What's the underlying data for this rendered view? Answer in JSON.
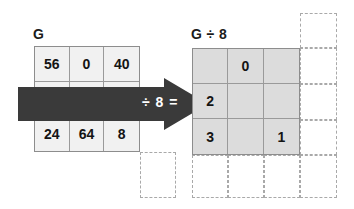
{
  "canvas": {
    "width": 354,
    "height": 209,
    "background": "#ffffff"
  },
  "colors": {
    "source_cell_fill": "#f1f1f1",
    "result_cell_fill": "#dcdcdc",
    "grid_line": "#9a9a9a",
    "ghost_dash": "#a9a9a9",
    "arrow_fill": "#3a3a3a",
    "text": "#141414",
    "arrow_text": "#ffffff"
  },
  "source_grid": {
    "label": "G",
    "rows": 3,
    "cols": 3,
    "cells": [
      [
        "56",
        "0",
        "40"
      ],
      [
        "16",
        "32",
        "48"
      ],
      [
        "24",
        "64",
        "8"
      ]
    ]
  },
  "operation": {
    "arrow_label": "÷ 8 =",
    "divisor": "8",
    "symbol": "÷",
    "equals": "="
  },
  "result_grid": {
    "label": "G ÷ 8",
    "rows": 3,
    "cols": 3,
    "cells": [
      [
        "",
        "0",
        ""
      ],
      [
        "2",
        "",
        ""
      ],
      [
        "3",
        "",
        "1"
      ]
    ]
  },
  "ghost_cells": {
    "source_side_count": 1,
    "result_side_count": 8,
    "description": "dashed placeholder cells"
  }
}
